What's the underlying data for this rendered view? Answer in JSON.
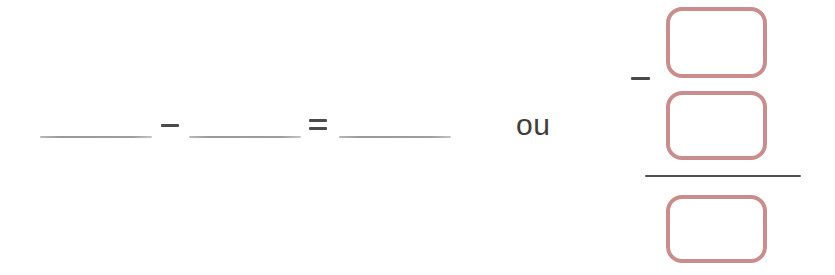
{
  "worksheet": {
    "background_color": "#ffffff",
    "left_expression": {
      "description": "fill-in-the-blank subtraction equation",
      "blank_1": {
        "value": "",
        "placeholder": ""
      },
      "operator_1": {
        "symbol": "−",
        "name": "minus"
      },
      "blank_2": {
        "value": "",
        "placeholder": ""
      },
      "operator_2": {
        "symbol": "=",
        "name": "equals"
      },
      "blank_3": {
        "value": "",
        "placeholder": ""
      }
    },
    "conjunction": {
      "label": "ou"
    },
    "right_expression": {
      "description": "fraction with empty answer boxes",
      "numerator": {
        "box_1": {
          "value": "",
          "placeholder": ""
        },
        "operator": {
          "symbol": "−",
          "name": "minus"
        },
        "box_2": {
          "value": "",
          "placeholder": ""
        }
      },
      "fraction_bar": {
        "name": "fraction-bar"
      },
      "denominator": {
        "box_3": {
          "value": "",
          "placeholder": ""
        }
      }
    },
    "colors": {
      "box_border": "#c98d8d",
      "blank_line": "#9e9e9e",
      "operator": "#4a4a4a",
      "fraction_bar": "#4f4f4f",
      "text": "#3d3d3d"
    }
  }
}
